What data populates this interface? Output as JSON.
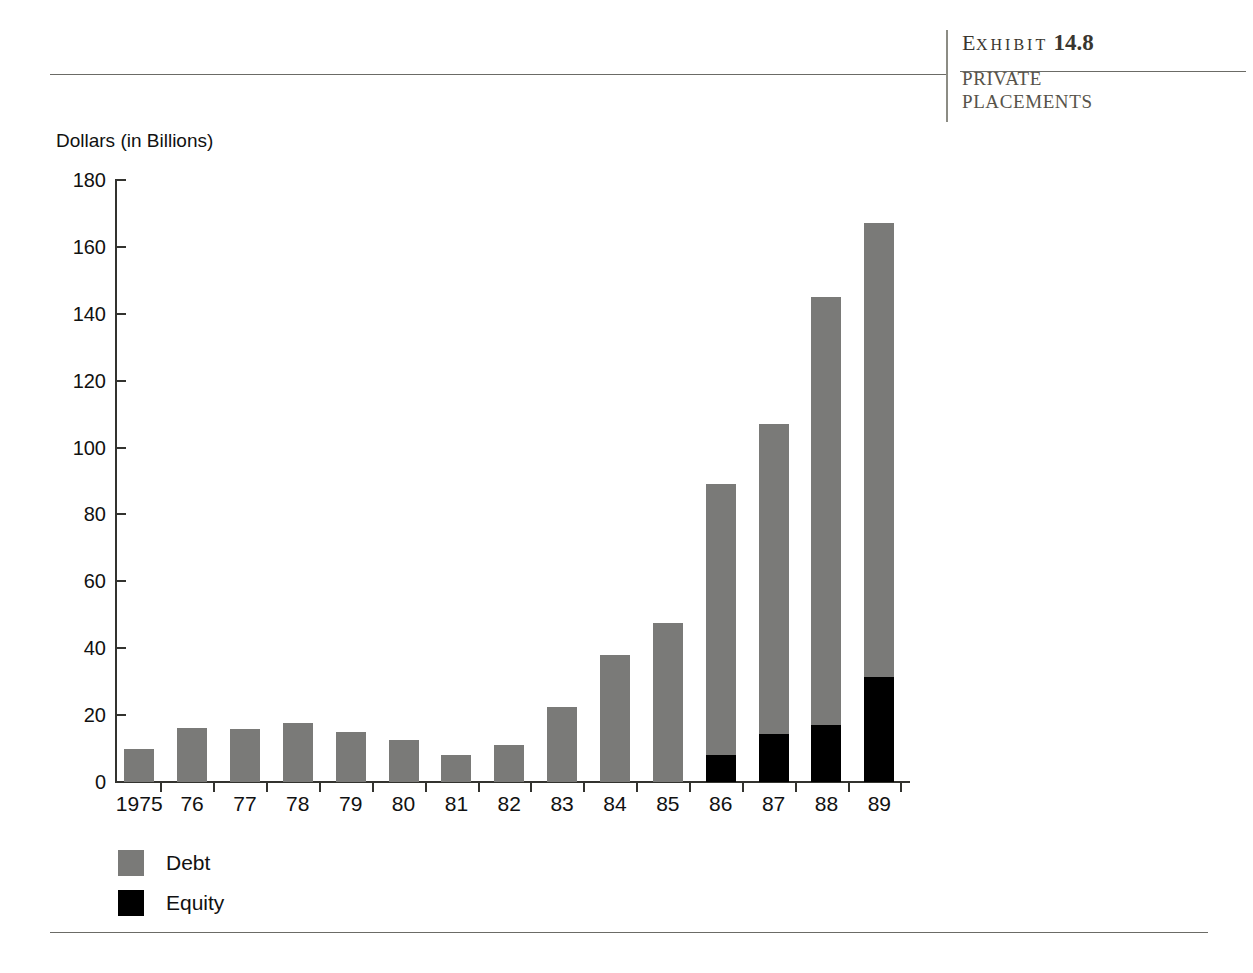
{
  "header": {
    "exhibit_prefix_first": "E",
    "exhibit_prefix_rest": "XHIBIT",
    "exhibit_number": "14.8",
    "exhibit_title_line1": "PRIVATE",
    "exhibit_title_line2": "PLACEMENTS"
  },
  "chart_data": {
    "type": "bar",
    "stacked": true,
    "title": "",
    "subtitle": "",
    "xlabel": "",
    "ylabel": "Dollars (in Billions)",
    "ylim": [
      0,
      180
    ],
    "ytick_step": 20,
    "yticks": [
      "0",
      "20",
      "40",
      "60",
      "80",
      "100",
      "120",
      "140",
      "160",
      "180"
    ],
    "grid": false,
    "legend_position": "bottom-left",
    "categories": [
      "1975",
      "76",
      "77",
      "78",
      "79",
      "80",
      "81",
      "82",
      "83",
      "84",
      "85",
      "86",
      "87",
      "88",
      "89"
    ],
    "series": [
      {
        "name": "Debt",
        "color": "#7a7a78",
        "values": [
          10,
          16,
          15.8,
          17.5,
          15,
          12.5,
          8,
          11,
          22.5,
          38,
          47.5,
          81,
          92.5,
          128,
          135.5
        ]
      },
      {
        "name": "Equity",
        "color": "#000000",
        "values": [
          0,
          0,
          0,
          0,
          0,
          0,
          0,
          0,
          0,
          0,
          0,
          8,
          14.5,
          17,
          31.5
        ]
      }
    ],
    "totals": [
      10,
      16,
      15.8,
      17.5,
      15,
      12.5,
      8,
      11,
      22.5,
      38,
      47.5,
      89,
      107,
      145,
      167
    ]
  },
  "legend": {
    "items": [
      {
        "label": "Debt",
        "color": "#7a7a78"
      },
      {
        "label": "Equity",
        "color": "#000000"
      }
    ]
  }
}
